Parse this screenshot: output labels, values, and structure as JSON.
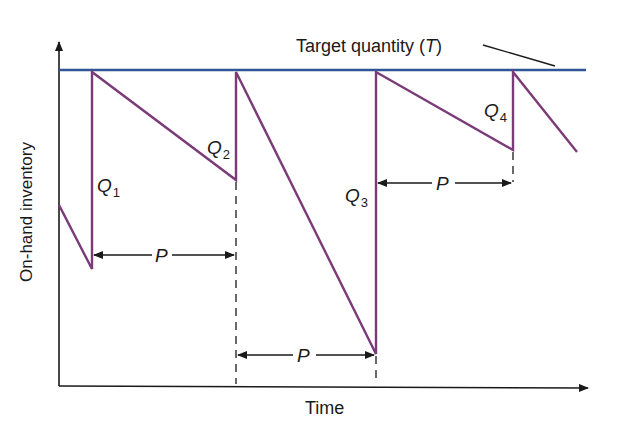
{
  "diagram": {
    "type": "periodic-review inventory system",
    "axes": {
      "x_label": "Time",
      "y_label": "On-hand inventory"
    },
    "target": {
      "label_prefix": "Target quantity (",
      "symbol": "T",
      "label_suffix": ")",
      "color": "#2f5597"
    },
    "inventory_line_color": "#7b3a78",
    "orders": [
      {
        "label": "Q",
        "sub": "1"
      },
      {
        "label": "Q",
        "sub": "2"
      },
      {
        "label": "Q",
        "sub": "3"
      },
      {
        "label": "Q",
        "sub": "4"
      }
    ],
    "period_label": "P",
    "period_markers": [
      {
        "label": "P",
        "from": "Q1",
        "to": "Q2"
      },
      {
        "label": "P",
        "from": "Q2",
        "to": "Q3"
      },
      {
        "label": "P",
        "from": "Q3",
        "to": "Q4"
      }
    ]
  }
}
